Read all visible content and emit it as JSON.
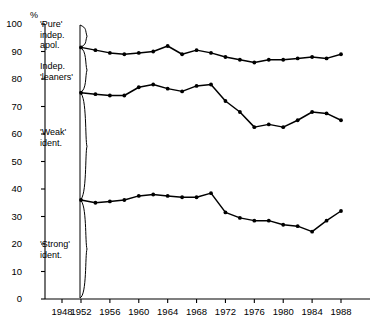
{
  "chart_data": {
    "type": "line",
    "title": "",
    "xlabel": "",
    "ylabel": "%",
    "ylim": [
      0,
      100
    ],
    "xlim": [
      1946,
      1990
    ],
    "grid": false,
    "legend": "none",
    "y_ticks": [
      0,
      10,
      20,
      30,
      40,
      50,
      60,
      70,
      80,
      90,
      100
    ],
    "x_ticks": [
      1948,
      1952,
      1956,
      1960,
      1964,
      1968,
      1972,
      1976,
      1980,
      1984,
      1988
    ],
    "axis_break_after": 1948,
    "annotations": [
      {
        "text": "'Pure'\nindep.\napol.",
        "lines": [
          "'Pure'",
          "indep.",
          "apol."
        ],
        "band": "top"
      },
      {
        "text": "Indep.\n'leaners'",
        "lines": [
          "Indep.",
          "'leaners'"
        ],
        "band": "second"
      },
      {
        "text": "'Weak'\nident.",
        "lines": [
          "'Weak'",
          "ident."
        ],
        "band": "third"
      },
      {
        "text": "'Strong'\nident.",
        "lines": [
          "'Strong'",
          "ident."
        ],
        "band": "bottom"
      }
    ],
    "x": [
      1952,
      1954,
      1956,
      1958,
      1960,
      1962,
      1964,
      1966,
      1968,
      1970,
      1972,
      1974,
      1976,
      1978,
      1980,
      1982,
      1984,
      1986,
      1988
    ],
    "series": [
      {
        "name": "cumulative-upper",
        "values": [
          91.5,
          90.5,
          89.5,
          89.0,
          89.5,
          90.0,
          92.0,
          89.0,
          90.5,
          89.5,
          88.0,
          87.0,
          86.0,
          87.0,
          87.0,
          87.5,
          88.0,
          87.5,
          89.0
        ]
      },
      {
        "name": "cumulative-middle",
        "values": [
          75.0,
          74.5,
          74.0,
          74.0,
          77.0,
          78.0,
          76.5,
          75.5,
          77.5,
          78.0,
          72.0,
          68.0,
          62.5,
          63.5,
          62.5,
          65.0,
          68.0,
          67.5,
          65.0
        ]
      },
      {
        "name": "cumulative-lower",
        "values": [
          36.0,
          35.0,
          35.5,
          36.0,
          37.5,
          38.0,
          37.5,
          37.0,
          37.0,
          38.5,
          31.5,
          29.5,
          28.5,
          28.5,
          27.0,
          26.5,
          24.5,
          28.5,
          32.0
        ]
      }
    ]
  },
  "labels": {
    "unit": "%",
    "band_top_l1": "'Pure'",
    "band_top_l2": "indep.",
    "band_top_l3": "apol.",
    "band_second_l1": "Indep.",
    "band_second_l2": "'leaners'",
    "band_third_l1": "'Weak'",
    "band_third_l2": "ident.",
    "band_bottom_l1": "'Strong'",
    "band_bottom_l2": "ident."
  },
  "colors": {
    "line": "#000000",
    "axis": "#000000",
    "background": "#ffffff"
  }
}
